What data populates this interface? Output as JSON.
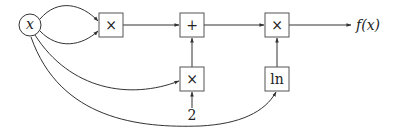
{
  "diagram": {
    "type": "computational-graph",
    "nodes": {
      "input": {
        "label": "x",
        "shape": "circle"
      },
      "mul1": {
        "label": "×",
        "shape": "box"
      },
      "add": {
        "label": "+",
        "shape": "box"
      },
      "mul_out": {
        "label": "×",
        "shape": "box"
      },
      "mul2": {
        "label": "×",
        "shape": "box"
      },
      "ln": {
        "label": "ln",
        "shape": "box"
      },
      "const": {
        "label": "2",
        "shape": "text"
      },
      "output": {
        "label": "f(x)",
        "shape": "text"
      }
    },
    "edges": [
      {
        "from": "input",
        "to": "mul1",
        "note": "upper curve"
      },
      {
        "from": "input",
        "to": "mul1",
        "note": "lower curve"
      },
      {
        "from": "input",
        "to": "mul2"
      },
      {
        "from": "input",
        "to": "ln"
      },
      {
        "from": "const",
        "to": "mul2"
      },
      {
        "from": "mul1",
        "to": "add"
      },
      {
        "from": "mul2",
        "to": "add"
      },
      {
        "from": "add",
        "to": "mul_out"
      },
      {
        "from": "ln",
        "to": "mul_out"
      },
      {
        "from": "mul_out",
        "to": "output"
      }
    ]
  }
}
